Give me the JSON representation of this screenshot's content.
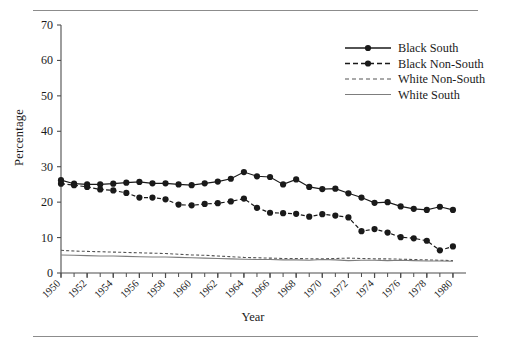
{
  "chart_data": {
    "type": "line",
    "title": "",
    "xlabel": "Year",
    "ylabel": "Percentage",
    "xlim": [
      1950,
      1981
    ],
    "ylim": [
      0,
      70
    ],
    "ytick_labels": [
      "0",
      "10",
      "20",
      "30",
      "40",
      "50",
      "60",
      "70"
    ],
    "yticks": [
      0,
      10,
      20,
      30,
      40,
      50,
      60,
      70
    ],
    "xtick_labels": [
      "1950",
      "1952",
      "1954",
      "1956",
      "1958",
      "1960",
      "1962",
      "1964",
      "1966",
      "1968",
      "1970",
      "1972",
      "1974",
      "1976",
      "1978",
      "1980"
    ],
    "xticks": [
      1950,
      1952,
      1954,
      1956,
      1958,
      1960,
      1962,
      1964,
      1966,
      1968,
      1970,
      1972,
      1974,
      1976,
      1978,
      1980
    ],
    "grid": false,
    "legend_position": "top-right",
    "x": [
      1950,
      1951,
      1952,
      1953,
      1954,
      1955,
      1956,
      1957,
      1958,
      1959,
      1960,
      1961,
      1962,
      1963,
      1964,
      1965,
      1966,
      1967,
      1968,
      1969,
      1970,
      1971,
      1972,
      1973,
      1974,
      1975,
      1976,
      1977,
      1978,
      1979,
      1980
    ],
    "series": [
      {
        "name": "Black South",
        "color": "#1a1a1a",
        "style": "solid",
        "marker": "circle",
        "values": [
          26.2,
          25.2,
          25.0,
          25.0,
          25.2,
          25.5,
          25.7,
          25.3,
          25.3,
          25.0,
          24.8,
          25.3,
          25.8,
          26.6,
          28.5,
          27.3,
          27.1,
          25.0,
          26.4,
          24.3,
          23.7,
          23.8,
          22.5,
          21.3,
          19.8,
          20.0,
          18.8,
          18.1,
          17.8,
          18.7,
          17.8
        ]
      },
      {
        "name": "Black Non-South",
        "color": "#1a1a1a",
        "style": "dashed",
        "marker": "circle",
        "values": [
          25.2,
          24.8,
          24.3,
          23.6,
          23.3,
          22.6,
          21.3,
          21.3,
          20.8,
          19.3,
          19.1,
          19.5,
          19.7,
          20.2,
          21.0,
          18.4,
          17.0,
          16.9,
          16.7,
          15.9,
          16.6,
          16.2,
          15.7,
          11.8,
          12.4,
          11.4,
          10.1,
          9.8,
          9.1,
          6.4,
          7.5
        ]
      },
      {
        "name": "White Non-South",
        "color": "#555555",
        "style": "dashed",
        "marker": "none",
        "values": [
          6.4,
          6.2,
          6.1,
          6.0,
          5.9,
          5.8,
          5.7,
          5.6,
          5.5,
          5.3,
          5.1,
          5.0,
          4.8,
          4.6,
          4.4,
          4.3,
          4.2,
          4.1,
          4.1,
          4.0,
          4.0,
          4.1,
          4.2,
          4.1,
          4.0,
          4.0,
          3.9,
          3.8,
          3.7,
          3.6,
          3.5
        ]
      },
      {
        "name": "White South",
        "color": "#7d7d7d",
        "style": "solid",
        "marker": "none",
        "values": [
          5.1,
          5.0,
          4.9,
          4.8,
          4.8,
          4.7,
          4.6,
          4.5,
          4.5,
          4.4,
          4.3,
          4.2,
          4.1,
          4.0,
          3.9,
          3.8,
          3.8,
          3.7,
          3.7,
          3.6,
          3.8,
          3.7,
          3.5,
          3.6,
          3.6,
          3.5,
          3.6,
          3.5,
          3.4,
          3.4,
          3.3
        ]
      }
    ]
  },
  "legend": {
    "items": [
      {
        "label": "Black South"
      },
      {
        "label": "Black Non-South"
      },
      {
        "label": "White Non-South"
      },
      {
        "label": "White South"
      }
    ]
  }
}
